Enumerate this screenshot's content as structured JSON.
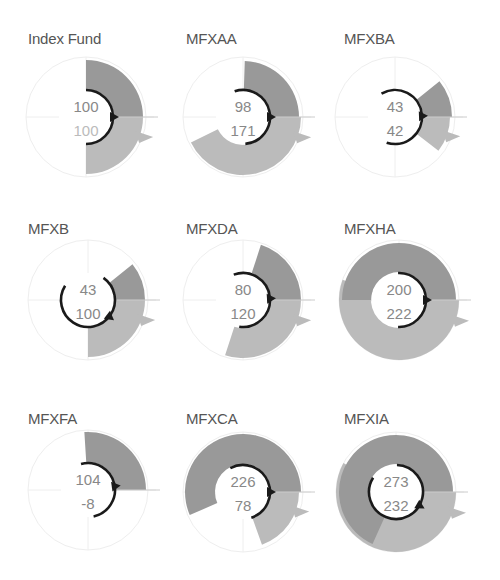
{
  "colors": {
    "top_wedge": "#999999",
    "bottom_wedge": "#bbbbbb",
    "arc": "#1a1a1a",
    "grid": "#eeeeee",
    "value_text": "#888888",
    "value_text_light": "#bbbbbb",
    "title": "#555555"
  },
  "chart_data": [
    {
      "type": "radial",
      "title": "Index Fund",
      "top_value": 100,
      "bottom_value": 100,
      "top_radius": 57,
      "bottom_radius": 57,
      "arc": [
        90,
        -90
      ],
      "arrow_angle": 0,
      "bottom_text_light": true
    },
    {
      "type": "radial",
      "title": "MFXAA",
      "top_value": 98,
      "bottom_value": 171,
      "top_radius": 56,
      "bottom_radius": 58,
      "arc": [
        108,
        -85
      ],
      "arrow_angle": 0,
      "bottom_text_light": false
    },
    {
      "type": "radial",
      "title": "MFXBA",
      "top_value": 43,
      "bottom_value": 42,
      "top_radius": 57,
      "bottom_radius": 55,
      "arc": [
        120,
        -108
      ],
      "arrow_angle": 2,
      "bottom_text_light": false
    },
    {
      "type": "radial",
      "title": "MFXB",
      "top_value": 43,
      "bottom_value": 100,
      "top_radius": 57,
      "bottom_radius": 57,
      "arc": [
        55,
        -212
      ],
      "arrow_angle": -38,
      "bottom_text_light": false
    },
    {
      "type": "radial",
      "title": "MFXDA",
      "top_value": 80,
      "bottom_value": 120,
      "top_radius": 58,
      "bottom_radius": 58,
      "arc": [
        110,
        -98
      ],
      "arrow_angle": 3,
      "bottom_text_light": false
    },
    {
      "type": "radial",
      "title": "MFXHA",
      "top_value": 200,
      "bottom_value": 222,
      "top_radius": 57,
      "bottom_radius": 60,
      "arc": [
        92,
        -92
      ],
      "arrow_angle": 0,
      "bottom_text_light": false
    },
    {
      "type": "radial",
      "title": "MFXFA",
      "top_value": 104,
      "bottom_value": -8,
      "top_radius": 58,
      "bottom_radius": 0,
      "arc": [
        105,
        -78
      ],
      "arrow_angle": 8,
      "bottom_text_light": false
    },
    {
      "type": "radial",
      "title": "MFXCA",
      "top_value": 226,
      "bottom_value": 78,
      "top_radius": 58,
      "bottom_radius": 56,
      "arc": [
        118,
        -72
      ],
      "arrow_angle": 0,
      "bottom_text_light": false
    },
    {
      "type": "radial",
      "title": "MFXIA",
      "top_value": 273,
      "bottom_value": 232,
      "top_radius": 57,
      "bottom_radius": 60,
      "arc": [
        88,
        -212
      ],
      "arrow_angle": -30,
      "bottom_text_light": false
    }
  ],
  "layout": {
    "degrees_per_unit": 0.9,
    "inner_radius": 28,
    "grid_radius": 60,
    "panels": [
      {
        "x": 28,
        "y": 30,
        "cx": 58,
        "cy": 87
      },
      {
        "x": 186,
        "y": 30,
        "cx": 57,
        "cy": 87
      },
      {
        "x": 344,
        "y": 30,
        "cx": 51,
        "cy": 87
      },
      {
        "x": 28,
        "y": 220,
        "cx": 60,
        "cy": 80
      },
      {
        "x": 186,
        "y": 220,
        "cx": 57,
        "cy": 80
      },
      {
        "x": 344,
        "y": 220,
        "cx": 55,
        "cy": 80
      },
      {
        "x": 28,
        "y": 410,
        "cx": 60,
        "cy": 80
      },
      {
        "x": 186,
        "y": 410,
        "cx": 57,
        "cy": 82
      },
      {
        "x": 344,
        "y": 410,
        "cx": 52,
        "cy": 82
      }
    ]
  }
}
